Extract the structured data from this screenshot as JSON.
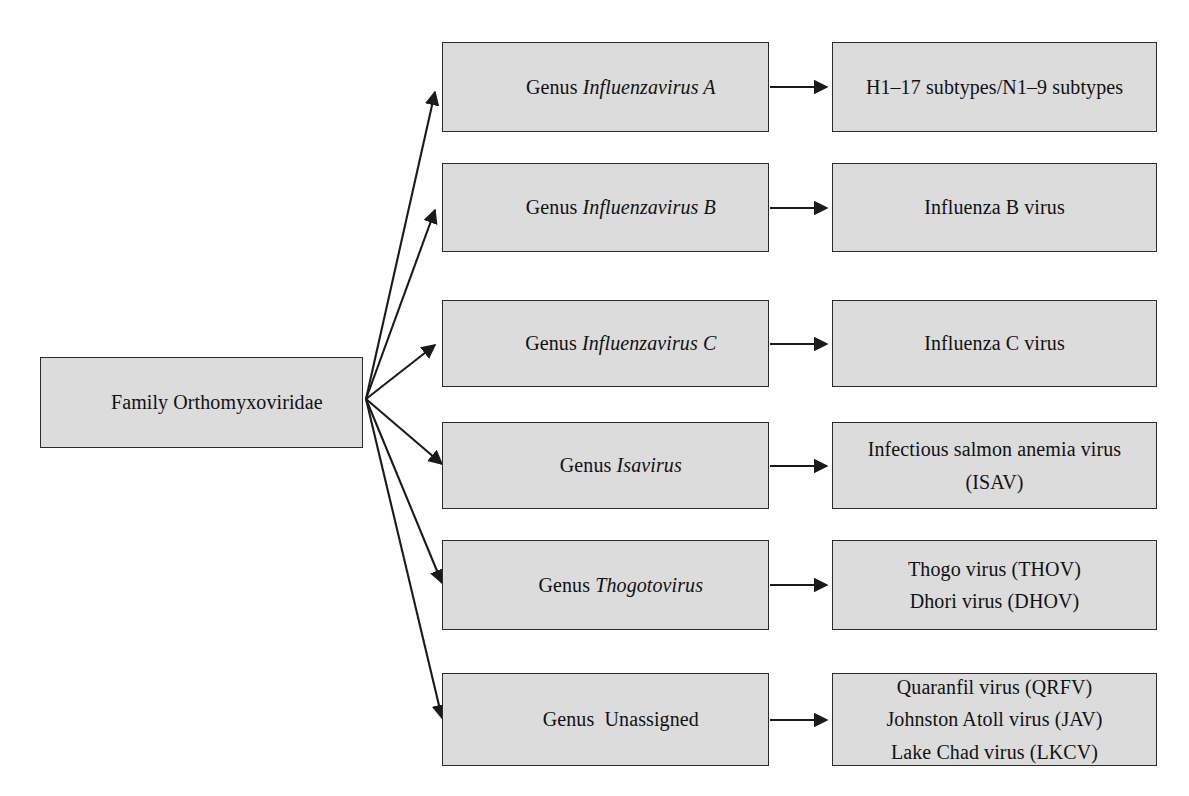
{
  "diagram": {
    "colors": {
      "box_fill": "#dcdcdc",
      "box_border": "#2b2b2b",
      "arrow": "#1a1a1a",
      "background": "#ffffff",
      "text": "#111111"
    },
    "root": {
      "label": "Family Orthomyxoviridae",
      "prefix": "Family ",
      "name": "Orthomyxoviridae",
      "italic": false
    },
    "rows": [
      {
        "id": "influenzavirus-a",
        "genus": {
          "prefix": "Genus ",
          "name": "Influenzavirus A",
          "italic": true
        },
        "species": {
          "lines": [
            "H1–17 subtypes/N1–9 subtypes"
          ]
        }
      },
      {
        "id": "influenzavirus-b",
        "genus": {
          "prefix": "Genus ",
          "name": "Influenzavirus B",
          "italic": true
        },
        "species": {
          "lines": [
            "Influenza B virus"
          ]
        }
      },
      {
        "id": "influenzavirus-c",
        "genus": {
          "prefix": "Genus ",
          "name": "Influenzavirus C",
          "italic": true
        },
        "species": {
          "lines": [
            "Influenza C virus"
          ]
        }
      },
      {
        "id": "isavirus",
        "genus": {
          "prefix": "Genus ",
          "name": "Isavirus",
          "italic": true
        },
        "species": {
          "lines": [
            "Infectious salmon anemia virus",
            "(ISAV)"
          ]
        }
      },
      {
        "id": "thogotovirus",
        "genus": {
          "prefix": "Genus ",
          "name": "Thogotovirus",
          "italic": true
        },
        "species": {
          "lines": [
            "Thogo virus (THOV)",
            "Dhori virus (DHOV)"
          ]
        }
      },
      {
        "id": "unassigned",
        "genus": {
          "prefix": "Genus  ",
          "name": "Unassigned",
          "italic": false
        },
        "species": {
          "lines": [
            "Quaranfil virus (QRFV)",
            "Johnston Atoll virus (JAV)",
            "Lake Chad virus (LKCV)"
          ]
        }
      }
    ],
    "geometry": {
      "root_box": {
        "x": 40,
        "y": 357,
        "w": 323,
        "h": 91
      },
      "fan_origin": {
        "x": 366,
        "y": 399
      },
      "genus_col": {
        "x": 442,
        "w": 327
      },
      "species_col": {
        "x": 832,
        "w": 325
      },
      "row_tops": [
        42,
        163,
        300,
        422,
        540,
        673
      ],
      "row_heights": [
        90,
        89,
        87,
        87,
        90,
        93
      ]
    }
  }
}
